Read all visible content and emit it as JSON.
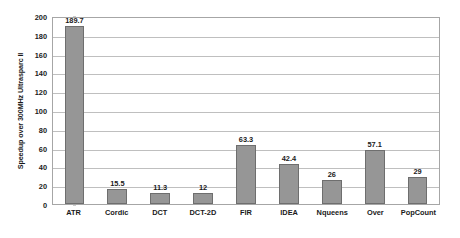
{
  "chart_data": {
    "type": "bar",
    "title": "",
    "xlabel": "",
    "ylabel": "Speedup over 300MHz Ultrasparc II",
    "ylim": [
      0,
      200
    ],
    "ytick_step": 20,
    "yticks": [
      200,
      180,
      160,
      140,
      120,
      100,
      80,
      60,
      40,
      20,
      0
    ],
    "ytick_labels": [
      "200",
      "180",
      "160",
      "140",
      "120",
      "100",
      "80",
      "60",
      "40",
      "20",
      "0"
    ],
    "grid": true,
    "grid_axis": "y",
    "legend": false,
    "legend_position": "none",
    "categories": [
      "ATR",
      "Cordic",
      "DCT",
      "DCT-2D",
      "FIR",
      "IDEA",
      "Nqueens",
      "Over",
      "PopCount"
    ],
    "values": [
      189.7,
      15.5,
      11.3,
      12,
      63.3,
      42.4,
      26,
      57.1,
      29
    ],
    "data_labels": [
      "189.7",
      "15.5",
      "11.3",
      "12",
      "63.3",
      "42.4",
      "26",
      "57.1",
      "29"
    ],
    "series": [
      {
        "name": "Speedup",
        "values": [
          189.7,
          15.5,
          11.3,
          12,
          63.3,
          42.4,
          26,
          57.1,
          29
        ]
      }
    ],
    "colors": {
      "bar_fill": "#969696",
      "bar_border": "#6e6e6e",
      "gridline": "#bfbfbf",
      "plot_border": "#a6a6a6",
      "text": "#1a1a1a",
      "background": "#ffffff"
    }
  }
}
